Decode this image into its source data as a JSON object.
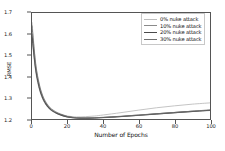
{
  "chart_data": {
    "type": "line",
    "title": "",
    "xlabel": "Number of Epochs",
    "ylabel": "RMSE",
    "xlim": [
      0,
      100
    ],
    "ylim": [
      1.2,
      1.7
    ],
    "xticks": [
      0,
      20,
      40,
      60,
      80,
      100
    ],
    "yticks": [
      "1.2",
      "1.3",
      "1.4",
      "1.5",
      "1.6",
      "1.7"
    ],
    "grid": false,
    "legend_position": "upper right",
    "x": [
      0,
      2,
      4,
      6,
      8,
      10,
      12,
      15,
      20,
      25,
      30,
      35,
      40,
      50,
      60,
      70,
      80,
      90,
      100
    ],
    "series": [
      {
        "name": "0% nuke attack",
        "color": "#bdbdbd",
        "width": 0.9,
        "values": [
          1.655,
          1.47,
          1.37,
          1.312,
          1.278,
          1.256,
          1.242,
          1.228,
          1.214,
          1.21,
          1.211,
          1.214,
          1.219,
          1.23,
          1.242,
          1.253,
          1.262,
          1.27,
          1.276
        ]
      },
      {
        "name": "10% nuke attack",
        "color": "#8a8a8a",
        "width": 0.9,
        "values": [
          1.585,
          1.43,
          1.345,
          1.295,
          1.265,
          1.246,
          1.234,
          1.222,
          1.209,
          1.204,
          1.203,
          1.204,
          1.206,
          1.211,
          1.217,
          1.223,
          1.229,
          1.235,
          1.24
        ]
      },
      {
        "name": "20% nuke attack",
        "color": "#4a4a4a",
        "width": 1.1,
        "values": [
          1.6,
          1.44,
          1.352,
          1.3,
          1.269,
          1.249,
          1.236,
          1.223,
          1.21,
          1.205,
          1.204,
          1.205,
          1.207,
          1.212,
          1.218,
          1.224,
          1.23,
          1.236,
          1.241
        ]
      },
      {
        "name": "30% nuke attack",
        "color": "#6f6f6f",
        "width": 0.9,
        "values": [
          1.64,
          1.462,
          1.365,
          1.308,
          1.275,
          1.253,
          1.24,
          1.226,
          1.212,
          1.206,
          1.205,
          1.206,
          1.208,
          1.213,
          1.219,
          1.225,
          1.231,
          1.237,
          1.243
        ]
      }
    ]
  }
}
